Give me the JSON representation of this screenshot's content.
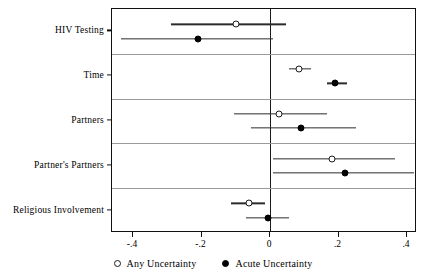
{
  "chart_data": {
    "type": "scatter",
    "subtype": "forest-plot",
    "title": "",
    "xlabel": "",
    "ylabel": "",
    "xlim": [
      -0.46,
      0.43
    ],
    "grid": false,
    "legend_position": "bottom",
    "xticks": [
      -0.4,
      -0.2,
      0,
      0.2,
      0.4
    ],
    "xticklabels": [
      "-.4",
      "-.2",
      "0",
      ".2",
      ".4"
    ],
    "reference_line": 0,
    "categories": [
      "HIV Testing",
      "Time",
      "Partners",
      "Partner's Partners",
      "Religious Involvement"
    ],
    "series": [
      {
        "name": "Any Uncertainty",
        "marker": "open-circle",
        "color": "#1a1a1a",
        "values": [
          -0.1,
          0.085,
          0.025,
          0.18,
          -0.06
        ],
        "ci_low": [
          -0.29,
          0.055,
          -0.105,
          0.01,
          -0.115
        ],
        "ci_high": [
          0.047,
          0.12,
          0.165,
          0.365,
          -0.015
        ]
      },
      {
        "name": "Acute Uncertainty",
        "marker": "filled-circle",
        "color": "#000000",
        "values": [
          -0.21,
          0.19,
          0.09,
          0.22,
          -0.005
        ],
        "ci_low": [
          -0.435,
          0.165,
          -0.055,
          0.01,
          -0.07
        ],
        "ci_high": [
          0.01,
          0.225,
          0.25,
          0.42,
          0.055
        ]
      }
    ]
  },
  "legend": {
    "items": [
      {
        "label": "Any Uncertainty",
        "marker": "open-circle"
      },
      {
        "label": "Acute Uncertainty",
        "marker": "filled-circle"
      }
    ]
  }
}
